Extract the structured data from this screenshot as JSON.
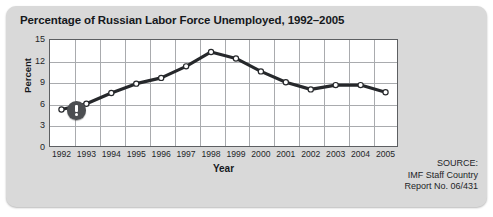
{
  "figure": {
    "title": "Percentage of Russian Labor Force Unemployed, 1992–2005",
    "callout_icon": "exclamation-badge-icon"
  },
  "source": {
    "line1": "SOURCE:",
    "line2": "IMF Staff Country",
    "line3": "Report No. 06/431"
  },
  "colors": {
    "panel": "#d9d9d9",
    "plot_background": "#ffffff",
    "grid": "#a9abae",
    "frame": "#5d5f62",
    "series": "#26282b",
    "marker_fill": "#ffffff",
    "badge": "#4c4e51",
    "text": "#15181c"
  },
  "chart_data": {
    "type": "line",
    "title": "Percentage of Russian Labor Force Unemployed, 1992–2005",
    "xlabel": "Year",
    "ylabel": "Percent",
    "categories": [
      "1992",
      "1993",
      "1994",
      "1995",
      "1996",
      "1997",
      "1998",
      "1999",
      "2000",
      "2001",
      "2002",
      "2003",
      "2004",
      "2005"
    ],
    "values": [
      5.2,
      6.0,
      7.5,
      8.8,
      9.6,
      11.2,
      13.2,
      12.3,
      10.5,
      9.0,
      8.0,
      8.6,
      8.6,
      7.6
    ],
    "series": [
      {
        "name": "Unemployment rate",
        "values": [
          5.2,
          6.0,
          7.5,
          8.8,
          9.6,
          11.2,
          13.2,
          12.3,
          10.5,
          9.0,
          8.0,
          8.6,
          8.6,
          7.6
        ]
      }
    ],
    "ylim": [
      0,
      15
    ],
    "yticks": [
      0,
      3,
      6,
      9,
      12,
      15
    ],
    "ytick_labels": [
      "0",
      "3",
      "6",
      "9",
      "12",
      "15"
    ],
    "xtick_labels": [
      "1992",
      "1993",
      "1994",
      "1995",
      "1996",
      "1997",
      "1998",
      "1999",
      "2000",
      "2001",
      "2002",
      "2003",
      "2004",
      "2005"
    ],
    "grid": true,
    "legend": false,
    "markers": "open-circle"
  }
}
